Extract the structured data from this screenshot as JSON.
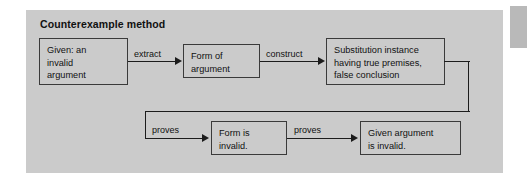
{
  "figure": {
    "title": "Counterexample method",
    "background_color": "#ffffff",
    "panel_color": "#cbcbcb",
    "line_color": "#1c1c1c",
    "box_border_color": "#3a3a3a",
    "text_color": "#111111"
  },
  "nodes": [
    {
      "id": "given-invalid-argument",
      "text": "Given: an\ninvalid\nargument"
    },
    {
      "id": "form-of-argument",
      "text": "Form of\nargument"
    },
    {
      "id": "substitution-instance",
      "text": "Substitution instance\nhaving true premises,\nfalse conclusion"
    },
    {
      "id": "form-is-invalid",
      "text": "Form is\ninvalid."
    },
    {
      "id": "given-argument-is-invalid",
      "text": "Given argument\nis invalid."
    }
  ],
  "edges": [
    {
      "id": "extract",
      "label": "extract"
    },
    {
      "id": "construct",
      "label": "construct"
    },
    {
      "id": "proves-form",
      "label": "proves"
    },
    {
      "id": "proves-argument",
      "label": "proves"
    }
  ]
}
